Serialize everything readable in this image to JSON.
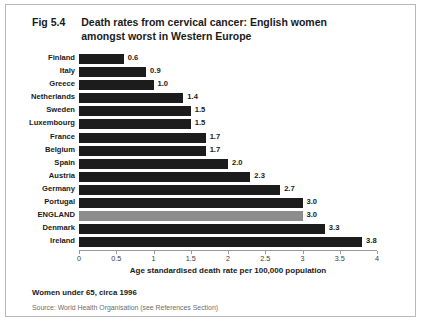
{
  "figure": {
    "number": "Fig 5.4",
    "title_line1": "Death rates from cervical cancer:  English women",
    "title_line2": "amongst worst in Western Europe",
    "footnote": "Women under 65, circa 1996",
    "source": "Source: World Health Organisation (see References Section)"
  },
  "colors": {
    "bar": "#1c1c1c",
    "highlight_bar": "#8d8d8d",
    "frame": "#b9b9b9",
    "axis": "#9a9a9a",
    "text": "#1a1a1a",
    "source_text": "#6d6d6d",
    "background": "#ffffff"
  },
  "chart_data": {
    "type": "bar",
    "orientation": "horizontal",
    "title": "Death rates from cervical cancer:  English women amongst worst in Western Europe",
    "xlabel": "Age standardised death rate per 100,000 population",
    "ylabel": "",
    "xlim": [
      0,
      4
    ],
    "xticks": [
      0,
      0.5,
      1,
      1.5,
      2,
      2.5,
      3,
      3.5,
      4
    ],
    "xticklabels": [
      "0",
      "0.5",
      "1",
      "1.5",
      "2",
      "2.5",
      "3",
      "3.5",
      "4"
    ],
    "grid": false,
    "legend": false,
    "highlight_category": "ENGLAND",
    "categories": [
      "Finland",
      "Italy",
      "Greece",
      "Netherlands",
      "Sweden",
      "Luxembourg",
      "France",
      "Belgium",
      "Spain",
      "Austria",
      "Germany",
      "Portugal",
      "ENGLAND",
      "Denmark",
      "Ireland"
    ],
    "values": [
      0.6,
      0.9,
      1.0,
      1.4,
      1.5,
      1.5,
      1.7,
      1.7,
      2.0,
      2.3,
      2.7,
      3.0,
      3.0,
      3.3,
      3.8
    ],
    "value_labels": [
      "0.6",
      "0.9",
      "1.0",
      "1.4",
      "1.5",
      "1.5",
      "1.7",
      "1.7",
      "2.0",
      "2.3",
      "2.7",
      "3.0",
      "3.0",
      "3.3",
      "3.8"
    ]
  }
}
